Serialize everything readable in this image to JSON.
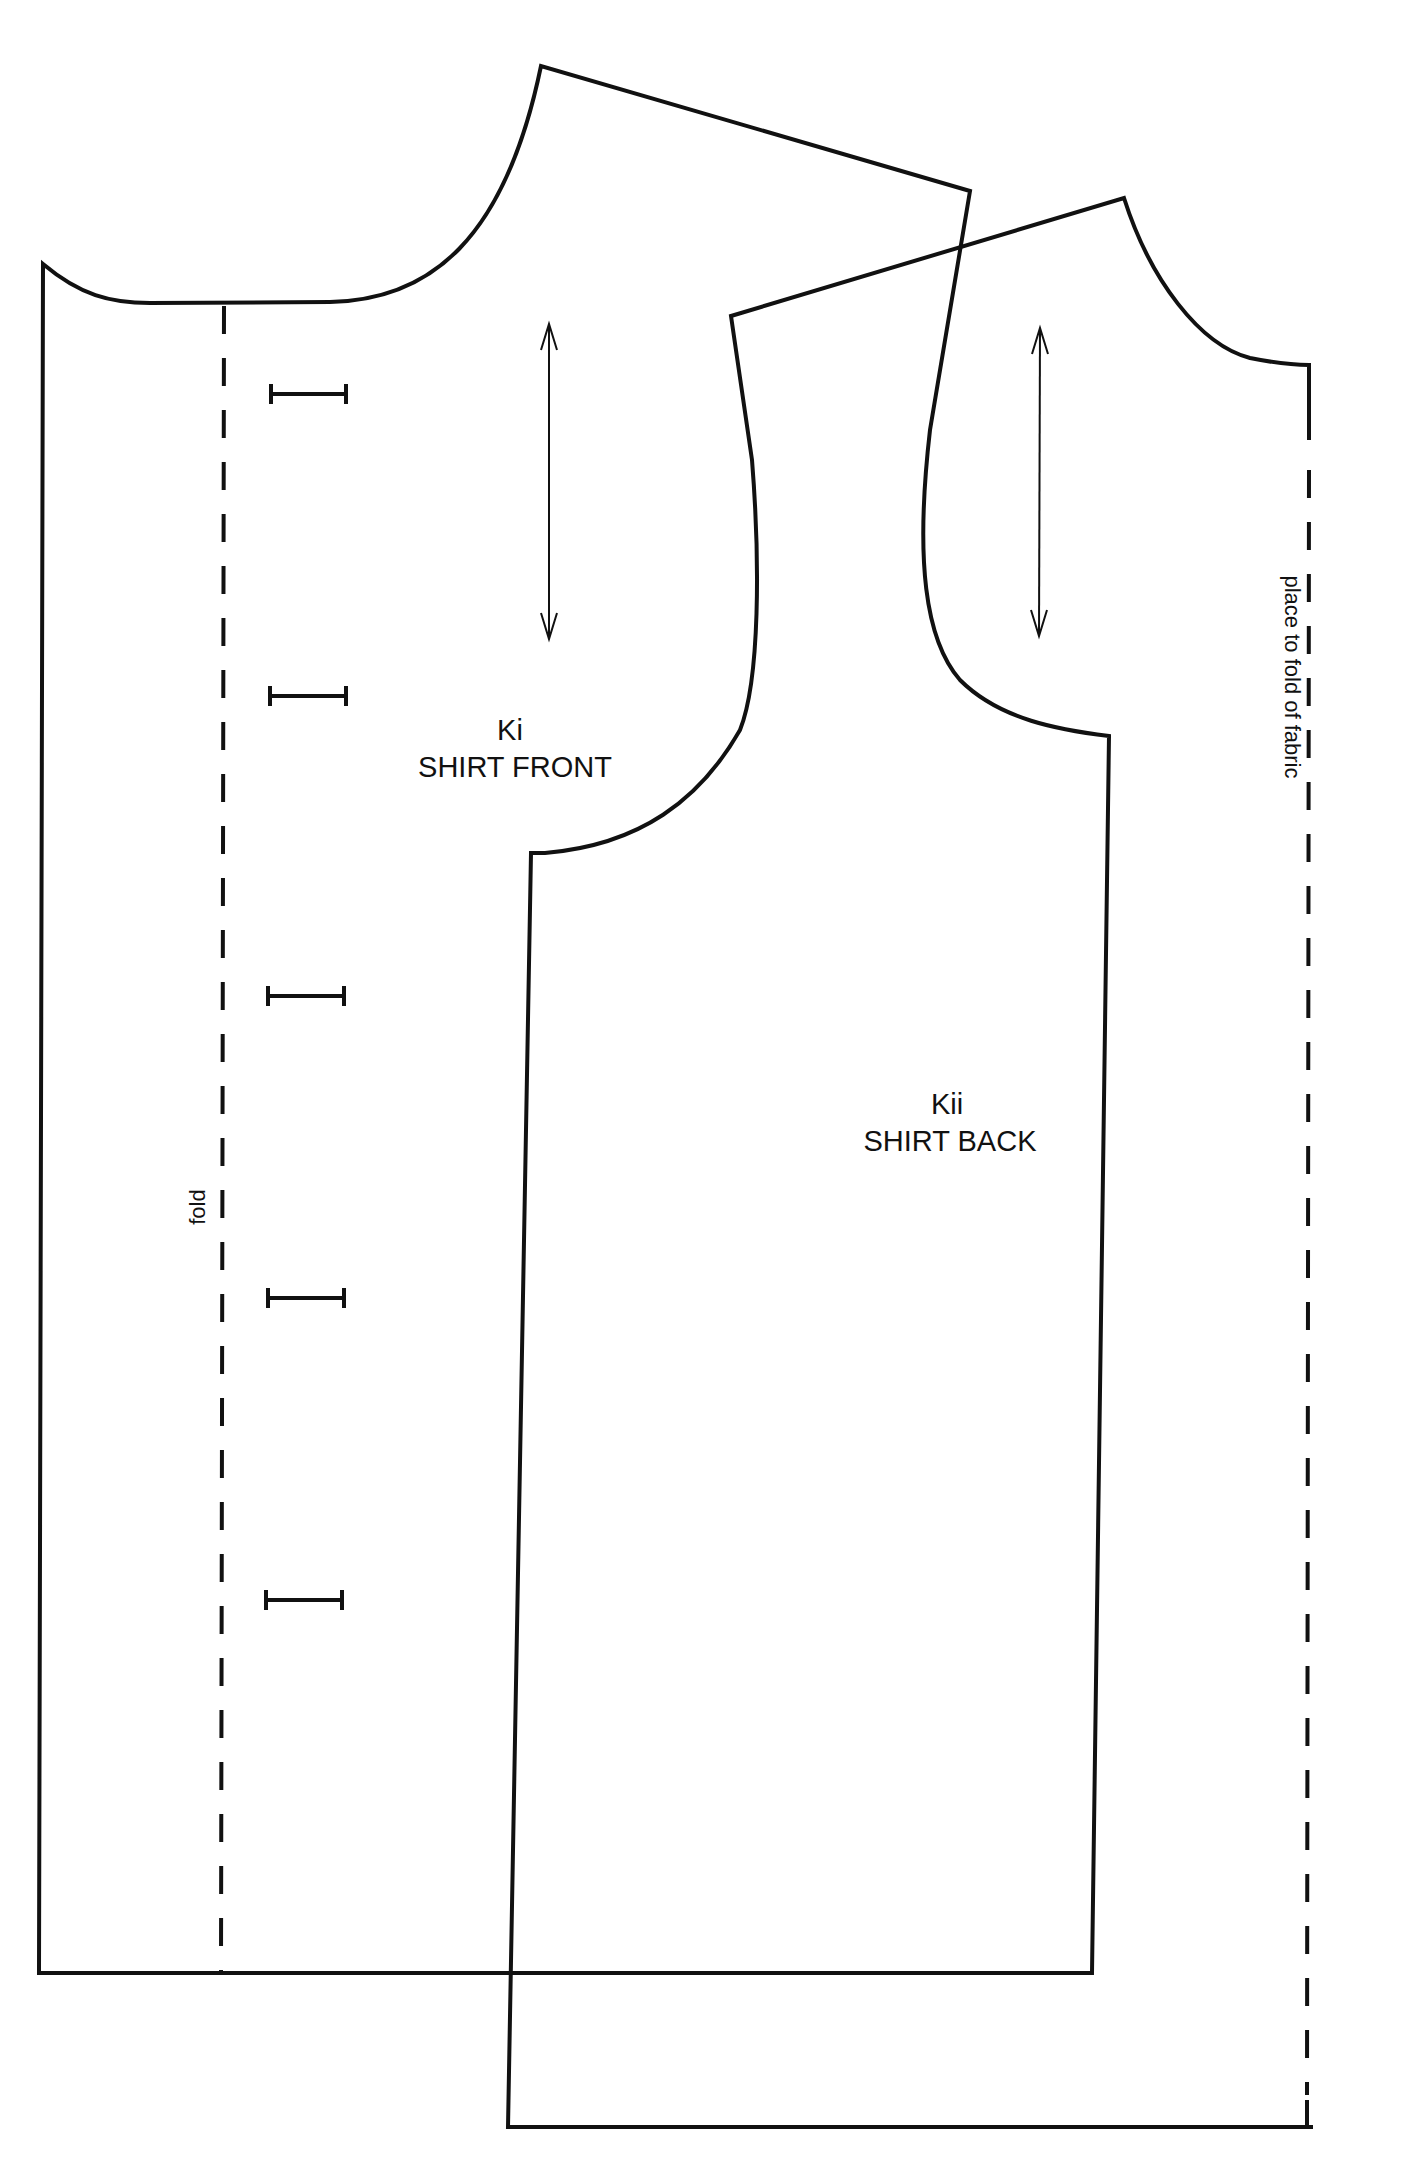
{
  "pattern": {
    "pieces": [
      {
        "id": "front",
        "code": "Ki",
        "name": "SHIRT FRONT",
        "fold_label": "fold",
        "buttonhole_count": 5
      },
      {
        "id": "back",
        "code": "Kii",
        "name": "SHIRT BACK",
        "fold_label": "place to fold of fabric"
      }
    ],
    "line_color": "#111111",
    "background": "#ffffff"
  }
}
